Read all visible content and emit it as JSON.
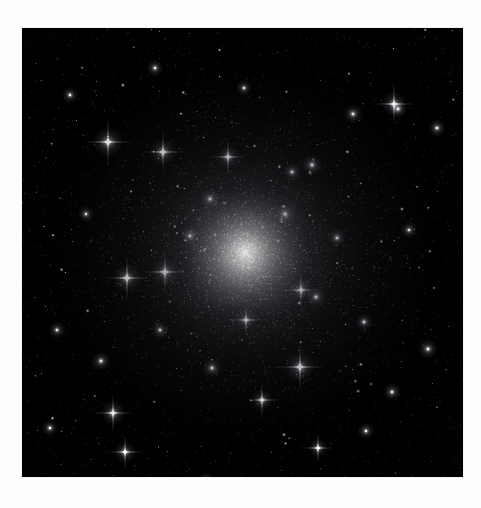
{
  "page": {
    "background_color": "#ffffff",
    "width": 481,
    "height": 508
  },
  "figure": {
    "name": "globular-cluster-photograph",
    "kind": "astronomical-image",
    "palette": "monochrome",
    "caption": "",
    "plate": {
      "left": 22,
      "top": 28,
      "width": 441,
      "height": 449,
      "background_color": "#010102",
      "border_color": "#e8e8e8"
    },
    "cluster": {
      "center_x": 245,
      "center_y": 252,
      "core_radius": 34,
      "halo_radius": 150,
      "core_color": "#ffffff",
      "halo_color": "#d8d8de"
    },
    "starfield": {
      "background_star_count": 2600,
      "cluster_star_count": 3400,
      "star_color": "#ffffff",
      "faint_star_color": "#9aa0a8"
    },
    "bright_stars": [
      {
        "x": 108,
        "y": 142,
        "r": 3.4,
        "spikes": true
      },
      {
        "x": 163,
        "y": 152,
        "r": 3.0,
        "spikes": true
      },
      {
        "x": 127,
        "y": 278,
        "r": 3.3,
        "spikes": true
      },
      {
        "x": 165,
        "y": 272,
        "r": 3.2,
        "spikes": true
      },
      {
        "x": 300,
        "y": 367,
        "r": 3.4,
        "spikes": true
      },
      {
        "x": 394,
        "y": 104,
        "r": 2.8,
        "spikes": true
      },
      {
        "x": 262,
        "y": 400,
        "r": 2.4,
        "spikes": true
      },
      {
        "x": 125,
        "y": 452,
        "r": 2.4,
        "spikes": true
      },
      {
        "x": 113,
        "y": 413,
        "r": 2.7,
        "spikes": true
      },
      {
        "x": 101,
        "y": 361,
        "r": 2.2,
        "spikes": false
      },
      {
        "x": 228,
        "y": 157,
        "r": 2.6,
        "spikes": true
      },
      {
        "x": 301,
        "y": 290,
        "r": 2.6,
        "spikes": true
      },
      {
        "x": 316,
        "y": 297,
        "r": 2.3,
        "spikes": false
      },
      {
        "x": 312,
        "y": 165,
        "r": 2.4,
        "spikes": false
      },
      {
        "x": 353,
        "y": 114,
        "r": 2.2,
        "spikes": false
      },
      {
        "x": 398,
        "y": 109,
        "r": 2.0,
        "spikes": false
      },
      {
        "x": 364,
        "y": 322,
        "r": 2.0,
        "spikes": false
      },
      {
        "x": 318,
        "y": 448,
        "r": 2.1,
        "spikes": true
      },
      {
        "x": 206,
        "y": 481,
        "r": 2.0,
        "spikes": false
      },
      {
        "x": 57,
        "y": 330,
        "r": 1.9,
        "spikes": false
      },
      {
        "x": 428,
        "y": 349,
        "r": 2.2,
        "spikes": false
      },
      {
        "x": 392,
        "y": 392,
        "r": 2.0,
        "spikes": false
      },
      {
        "x": 246,
        "y": 320,
        "r": 2.5,
        "spikes": true
      },
      {
        "x": 210,
        "y": 199,
        "r": 2.3,
        "spikes": false
      },
      {
        "x": 285,
        "y": 214,
        "r": 2.4,
        "spikes": false
      },
      {
        "x": 190,
        "y": 236,
        "r": 2.2,
        "spikes": false
      },
      {
        "x": 292,
        "y": 172,
        "r": 2.1,
        "spikes": false
      },
      {
        "x": 337,
        "y": 238,
        "r": 2.1,
        "spikes": false
      },
      {
        "x": 160,
        "y": 330,
        "r": 2.0,
        "spikes": false
      },
      {
        "x": 212,
        "y": 368,
        "r": 2.2,
        "spikes": false
      },
      {
        "x": 437,
        "y": 128,
        "r": 2.0,
        "spikes": false
      },
      {
        "x": 86,
        "y": 214,
        "r": 1.8,
        "spikes": false
      },
      {
        "x": 155,
        "y": 68,
        "r": 1.9,
        "spikes": false
      },
      {
        "x": 244,
        "y": 88,
        "r": 1.8,
        "spikes": false
      },
      {
        "x": 366,
        "y": 431,
        "r": 1.9,
        "spikes": false
      },
      {
        "x": 70,
        "y": 95,
        "r": 1.8,
        "spikes": false
      },
      {
        "x": 409,
        "y": 230,
        "r": 1.9,
        "spikes": false
      },
      {
        "x": 50,
        "y": 428,
        "r": 1.8,
        "spikes": false
      }
    ]
  }
}
